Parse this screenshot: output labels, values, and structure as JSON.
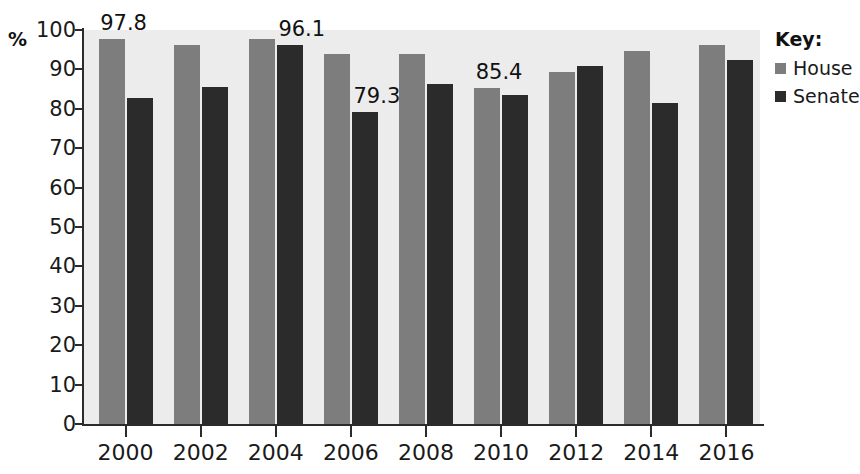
{
  "chart_data": {
    "type": "bar",
    "title": "",
    "xlabel": "",
    "ylabel": "%",
    "ylim": [
      0,
      100
    ],
    "ytick_step": 10,
    "yticks": [
      0,
      10,
      20,
      30,
      40,
      50,
      60,
      70,
      80,
      90,
      100
    ],
    "grid": false,
    "legend_position": "right",
    "legend_title": "Key:",
    "categories": [
      "2000",
      "2002",
      "2004",
      "2006",
      "2008",
      "2010",
      "2012",
      "2014",
      "2016"
    ],
    "series": [
      {
        "name": "House",
        "color": "#7d7d7d",
        "values": [
          97.8,
          96.3,
          97.7,
          94.0,
          94.0,
          85.4,
          89.3,
          94.8,
          96.2
        ]
      },
      {
        "name": "Senate",
        "color": "#2b2b2b",
        "values": [
          82.8,
          85.5,
          96.1,
          79.3,
          86.3,
          83.4,
          90.8,
          81.5,
          92.5
        ]
      }
    ],
    "annotations": [
      {
        "text": "97.8",
        "series": "House",
        "category": "2000"
      },
      {
        "text": "96.1",
        "series": "Senate",
        "category": "2004"
      },
      {
        "text": "79.3",
        "series": "Senate",
        "category": "2006"
      },
      {
        "text": "85.4",
        "series": "House",
        "category": "2010"
      }
    ],
    "plot_background": "#ececec",
    "axis_color": "#2b2b2b"
  },
  "legend": {
    "title": "Key:",
    "items": [
      {
        "label": "House",
        "color": "#7d7d7d"
      },
      {
        "label": "Senate",
        "color": "#2b2b2b"
      }
    ]
  }
}
